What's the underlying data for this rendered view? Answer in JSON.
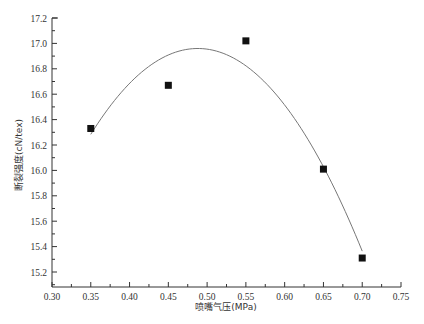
{
  "chart_data": {
    "type": "scatter",
    "title": "",
    "xlabel": "喷嘴气压(MPa)",
    "ylabel": "断裂强度(cN/tex)",
    "xlim": [
      0.3,
      0.75
    ],
    "ylim": [
      15.1,
      17.2
    ],
    "x_ticks": [
      "0.30",
      "0.35",
      "0.40",
      "0.45",
      "0.50",
      "0.55",
      "0.60",
      "0.65",
      "0.70",
      "0.75"
    ],
    "y_ticks": [
      "15.2",
      "15.4",
      "15.6",
      "15.8",
      "16.0",
      "16.2",
      "16.4",
      "16.6",
      "16.8",
      "17.0",
      "17.2"
    ],
    "grid": false,
    "legend": null,
    "series": [
      {
        "name": "measured",
        "marker": "square",
        "color": "#111111",
        "x": [
          0.35,
          0.45,
          0.55,
          0.65,
          0.7
        ],
        "y": [
          16.33,
          16.67,
          17.02,
          16.01,
          15.31
        ]
      },
      {
        "name": "quadratic fit",
        "type": "line",
        "color": "#777777",
        "x_range": [
          0.35,
          0.7
        ],
        "vertex": [
          0.488,
          16.96
        ],
        "curvature": 35.5,
        "x": [
          0.35,
          0.4,
          0.45,
          0.488,
          0.55,
          0.6,
          0.65,
          0.7
        ],
        "y": [
          16.28,
          16.69,
          16.91,
          16.96,
          16.82,
          16.51,
          16.03,
          15.37
        ]
      }
    ]
  }
}
